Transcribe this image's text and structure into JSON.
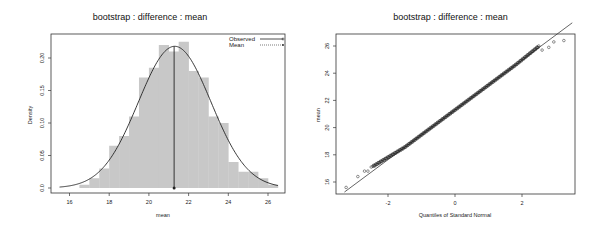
{
  "chart_data": [
    {
      "type": "bar",
      "subtype": "histogram-with-density",
      "title": "bootstrap : difference : mean",
      "xlabel": "mean",
      "ylabel": "Density",
      "xlim": [
        15.5,
        26.7
      ],
      "ylim": [
        0,
        0.23
      ],
      "x_ticks": [
        16,
        18,
        20,
        22,
        24,
        26
      ],
      "y_ticks": [
        0.0,
        0.05,
        0.1,
        0.15,
        0.2
      ],
      "y_tick_labels": [
        "0.0",
        "0.05",
        "0.10",
        "0.15",
        "0.20"
      ],
      "bin_width": 0.5,
      "bins": [
        {
          "x0": 16.5,
          "x1": 17.0,
          "density": 0.005
        },
        {
          "x0": 17.0,
          "x1": 17.5,
          "density": 0.015
        },
        {
          "x0": 17.5,
          "x1": 18.0,
          "density": 0.03
        },
        {
          "x0": 18.0,
          "x1": 18.5,
          "density": 0.065
        },
        {
          "x0": 18.5,
          "x1": 19.0,
          "density": 0.08
        },
        {
          "x0": 19.0,
          "x1": 19.5,
          "density": 0.11
        },
        {
          "x0": 19.5,
          "x1": 20.0,
          "density": 0.17
        },
        {
          "x0": 20.0,
          "x1": 20.5,
          "density": 0.185
        },
        {
          "x0": 20.5,
          "x1": 21.0,
          "density": 0.22
        },
        {
          "x0": 21.0,
          "x1": 21.5,
          "density": 0.21
        },
        {
          "x0": 21.5,
          "x1": 22.0,
          "density": 0.225
        },
        {
          "x0": 22.0,
          "x1": 22.5,
          "density": 0.18
        },
        {
          "x0": 22.5,
          "x1": 23.0,
          "density": 0.17
        },
        {
          "x0": 23.0,
          "x1": 23.5,
          "density": 0.11
        },
        {
          "x0": 23.5,
          "x1": 24.0,
          "density": 0.1
        },
        {
          "x0": 24.0,
          "x1": 24.5,
          "density": 0.04
        },
        {
          "x0": 24.5,
          "x1": 25.0,
          "density": 0.025
        },
        {
          "x0": 25.0,
          "x1": 25.5,
          "density": 0.025
        },
        {
          "x0": 25.5,
          "x1": 26.0,
          "density": 0.015
        },
        {
          "x0": 26.0,
          "x1": 26.5,
          "density": 0.005
        }
      ],
      "density_curve": {
        "type": "normal",
        "mean": 21.3,
        "sd": 1.83,
        "x_range": [
          15.5,
          26.5
        ]
      },
      "observed_value": 21.27,
      "legend": {
        "position": "topright",
        "entries": [
          "Observed",
          "Mean"
        ]
      }
    },
    {
      "type": "scatter",
      "subtype": "normal-qq-plot",
      "title": "bootstrap : difference : mean",
      "xlabel": "Quantiles of Standard Normal",
      "ylabel": "mean",
      "xlim": [
        -3.35,
        3.5
      ],
      "ylim": [
        15.3,
        26.9
      ],
      "x_ticks": [
        -2,
        0,
        2
      ],
      "y_ticks": [
        16,
        18,
        20,
        22,
        24,
        26
      ],
      "reference_line": {
        "intercept": 21.3,
        "slope": 1.83
      },
      "points_summary": "approximately linear from (-3.3, 15.6) to (3.3, 26.4), slight upward deviation in lower tail",
      "tail_points": [
        {
          "x": -3.25,
          "y": 15.6
        },
        {
          "x": -2.9,
          "y": 16.4
        },
        {
          "x": -2.7,
          "y": 16.8
        },
        {
          "x": -2.6,
          "y": 16.8
        },
        {
          "x": -2.5,
          "y": 17.1
        },
        {
          "x": 2.6,
          "y": 25.7
        },
        {
          "x": 2.8,
          "y": 25.9
        },
        {
          "x": 2.95,
          "y": 26.3
        },
        {
          "x": 3.25,
          "y": 26.4
        }
      ]
    }
  ],
  "left_panel": {
    "title": "bootstrap : difference : mean",
    "xlabel": "mean",
    "ylabel": "Density",
    "legend_observed": "Observed",
    "legend_mean": "Mean"
  },
  "right_panel": {
    "title": "bootstrap : difference : mean",
    "xlabel": "Quantiles of Standard Normal",
    "ylabel": "mean"
  },
  "colors": {
    "bar_fill": "#c8c8c8",
    "line": "#222222",
    "axis": "#333333"
  }
}
